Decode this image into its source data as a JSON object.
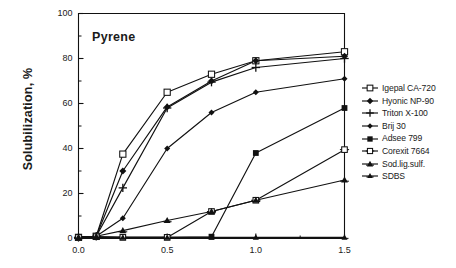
{
  "chart_data": {
    "type": "line",
    "title": "Pyrene",
    "xlabel": "",
    "ylabel": "Solubilization, %",
    "xlim": [
      0.0,
      1.5
    ],
    "ylim": [
      0,
      100
    ],
    "grid": false,
    "legend_position": "right",
    "x_ticks": [
      0.0,
      0.5,
      1.0,
      1.5
    ],
    "x_tick_labels": [
      "0.0",
      "0.5",
      "1.0",
      "1.5"
    ],
    "x_minor_ticks": [
      0.25,
      0.75,
      1.25
    ],
    "y_ticks": [
      0,
      20,
      40,
      60,
      80,
      100
    ],
    "y_tick_labels": [
      "0",
      "20",
      "40",
      "60",
      "80",
      "100"
    ],
    "y_minor_ticks": [
      10,
      30,
      50,
      70,
      90
    ],
    "series": [
      {
        "name": "Igepal CA-720",
        "marker": "open-square",
        "x": [
          0.0,
          0.1,
          0.25,
          0.5,
          0.75,
          1.0,
          1.5
        ],
        "values": [
          0.5,
          1.0,
          37.5,
          65.0,
          73.0,
          79.0,
          83.0
        ]
      },
      {
        "name": "Hyonic NP-90",
        "marker": "filled-diamond",
        "x": [
          0.0,
          0.1,
          0.25,
          0.5,
          0.75,
          1.0,
          1.5
        ],
        "values": [
          0.5,
          1.0,
          30.0,
          58.5,
          70.0,
          79.0,
          81.0
        ]
      },
      {
        "name": "Triton X-100",
        "marker": "plus",
        "x": [
          0.0,
          0.1,
          0.25,
          0.5,
          0.75,
          1.0,
          1.5
        ],
        "values": [
          0.5,
          1.0,
          22.5,
          58.0,
          69.5,
          76.0,
          80.0
        ]
      },
      {
        "name": "Brij 30",
        "marker": "filled-diamond-small",
        "x": [
          0.0,
          0.1,
          0.25,
          0.5,
          0.75,
          1.0,
          1.5
        ],
        "values": [
          0.5,
          1.0,
          9.0,
          40.0,
          56.0,
          65.0,
          71.0
        ]
      },
      {
        "name": "Adsee 799",
        "marker": "filled-square",
        "x": [
          0.0,
          0.1,
          0.25,
          0.5,
          0.75,
          1.0,
          1.5
        ],
        "values": [
          0.5,
          0.8,
          0.5,
          0.5,
          0.8,
          38.0,
          58.0
        ]
      },
      {
        "name": "Corexit 7664",
        "marker": "open-square-small",
        "x": [
          0.0,
          0.1,
          0.25,
          0.5,
          0.75,
          1.0,
          1.5
        ],
        "values": [
          0.5,
          0.8,
          0.5,
          0.5,
          12.0,
          17.0,
          39.5
        ]
      },
      {
        "name": "Sod.lig.sulf.",
        "marker": "filled-triangle",
        "x": [
          0.0,
          0.1,
          0.25,
          0.5,
          0.75,
          1.0,
          1.5
        ],
        "values": [
          0.5,
          1.0,
          3.5,
          8.0,
          12.0,
          17.0,
          26.0
        ]
      },
      {
        "name": "SDBS",
        "marker": "filled-triangle-small",
        "x": [
          0.0,
          0.1,
          0.25,
          0.5,
          0.75,
          1.0,
          1.5
        ],
        "values": [
          0.5,
          0.5,
          0.5,
          0.5,
          0.5,
          0.5,
          0.5
        ]
      }
    ]
  },
  "axes": {
    "y_axis_title": "Solubilization, %",
    "plot_label": "Pyrene"
  },
  "legend": {
    "entries": [
      {
        "label": "Igepal CA-720"
      },
      {
        "label": "Hyonic NP-90"
      },
      {
        "label": "Triton X-100"
      },
      {
        "label": "Brij 30"
      },
      {
        "label": "Adsee 799"
      },
      {
        "label": "Corexit 7664"
      },
      {
        "label": "Sod.lig.sulf."
      },
      {
        "label": "SDBS"
      }
    ]
  },
  "colors": {
    "line": "#111111",
    "axis": "#111111",
    "background": "#ffffff",
    "text": "#1a1a1a"
  }
}
